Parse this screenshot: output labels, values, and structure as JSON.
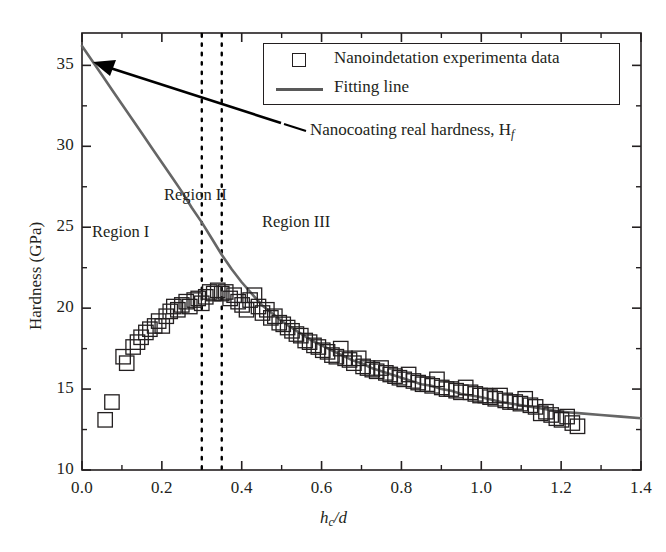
{
  "chart_data": {
    "type": "scatter",
    "title": "",
    "xlabel": "hc/d",
    "ylabel": "Hardness (GPa)",
    "xlim": [
      0.0,
      1.4
    ],
    "ylim": [
      10,
      37
    ],
    "grid": false,
    "x_ticks": [
      "0.0",
      "0.2",
      "0.4",
      "0.6",
      "0.8",
      "1.0",
      "1.2",
      "1.4"
    ],
    "x_tick_values": [
      0.0,
      0.2,
      0.4,
      0.6,
      0.8,
      1.0,
      1.2,
      1.4
    ],
    "y_ticks": [
      "10",
      "15",
      "20",
      "25",
      "30",
      "35"
    ],
    "y_tick_values": [
      10,
      15,
      20,
      25,
      30,
      35
    ],
    "minor_ticks": true,
    "legend_position": "top-right",
    "series": [
      {
        "name": "Nanoindetation experimenta data",
        "type": "scatter",
        "marker": "open-square",
        "color": "#231f20",
        "points": [
          [
            0.058,
            13.1
          ],
          [
            0.075,
            14.2
          ],
          [
            0.103,
            17.0
          ],
          [
            0.112,
            16.6
          ],
          [
            0.128,
            17.6
          ],
          [
            0.139,
            17.9
          ],
          [
            0.148,
            18.2
          ],
          [
            0.16,
            18.5
          ],
          [
            0.17,
            18.7
          ],
          [
            0.182,
            18.9
          ],
          [
            0.192,
            19.2
          ],
          [
            0.201,
            18.9
          ],
          [
            0.211,
            19.5
          ],
          [
            0.221,
            19.8
          ],
          [
            0.23,
            20.1
          ],
          [
            0.24,
            19.9
          ],
          [
            0.25,
            20.2
          ],
          [
            0.261,
            20.4
          ],
          [
            0.27,
            20.1
          ],
          [
            0.281,
            20.5
          ],
          [
            0.291,
            20.6
          ],
          [
            0.3,
            20.3
          ],
          [
            0.31,
            20.7
          ],
          [
            0.32,
            21.0
          ],
          [
            0.33,
            20.9
          ],
          [
            0.34,
            21.1
          ],
          [
            0.35,
            20.9
          ],
          [
            0.36,
            21.0
          ],
          [
            0.371,
            20.6
          ],
          [
            0.381,
            20.8
          ],
          [
            0.391,
            20.4
          ],
          [
            0.401,
            20.2
          ],
          [
            0.412,
            19.9
          ],
          [
            0.421,
            20.5
          ],
          [
            0.432,
            20.8
          ],
          [
            0.442,
            20.1
          ],
          [
            0.452,
            19.7
          ],
          [
            0.463,
            19.9
          ],
          [
            0.473,
            19.4
          ],
          [
            0.483,
            19.5
          ],
          [
            0.494,
            19.1
          ],
          [
            0.504,
            19.0
          ],
          [
            0.515,
            18.8
          ],
          [
            0.526,
            18.6
          ],
          [
            0.537,
            18.4
          ],
          [
            0.548,
            18.3
          ],
          [
            0.559,
            18.0
          ],
          [
            0.57,
            17.9
          ],
          [
            0.581,
            17.7
          ],
          [
            0.592,
            17.6
          ],
          [
            0.603,
            17.4
          ],
          [
            0.615,
            17.3
          ],
          [
            0.626,
            17.1
          ],
          [
            0.637,
            17.0
          ],
          [
            0.648,
            17.5
          ],
          [
            0.659,
            16.9
          ],
          [
            0.67,
            16.8
          ],
          [
            0.681,
            16.6
          ],
          [
            0.693,
            16.9
          ],
          [
            0.704,
            16.4
          ],
          [
            0.715,
            16.3
          ],
          [
            0.727,
            16.2
          ],
          [
            0.738,
            16.1
          ],
          [
            0.749,
            16.3
          ],
          [
            0.761,
            16.0
          ],
          [
            0.772,
            15.9
          ],
          [
            0.784,
            15.8
          ],
          [
            0.795,
            15.7
          ],
          [
            0.807,
            15.6
          ],
          [
            0.818,
            15.9
          ],
          [
            0.83,
            15.5
          ],
          [
            0.842,
            15.4
          ],
          [
            0.853,
            15.3
          ],
          [
            0.865,
            15.3
          ],
          [
            0.877,
            15.2
          ],
          [
            0.889,
            15.6
          ],
          [
            0.901,
            15.1
          ],
          [
            0.913,
            15.0
          ],
          [
            0.925,
            15.0
          ],
          [
            0.937,
            14.9
          ],
          [
            0.949,
            14.8
          ],
          [
            0.961,
            15.1
          ],
          [
            0.973,
            14.8
          ],
          [
            0.985,
            14.7
          ],
          [
            0.997,
            14.6
          ],
          [
            1.01,
            14.6
          ],
          [
            1.022,
            14.5
          ],
          [
            1.035,
            14.4
          ],
          [
            1.047,
            14.6
          ],
          [
            1.06,
            14.3
          ],
          [
            1.072,
            14.2
          ],
          [
            1.085,
            14.2
          ],
          [
            1.098,
            14.1
          ],
          [
            1.11,
            14.4
          ],
          [
            1.123,
            14.0
          ],
          [
            1.136,
            13.9
          ],
          [
            1.149,
            13.5
          ],
          [
            1.162,
            13.6
          ],
          [
            1.175,
            13.4
          ],
          [
            1.188,
            13.2
          ],
          [
            1.201,
            13.1
          ],
          [
            1.215,
            13.3
          ],
          [
            1.228,
            12.9
          ],
          [
            1.241,
            12.7
          ]
        ]
      },
      {
        "name": "Fitting line",
        "type": "line",
        "color": "#666666",
        "y_intercept": 36.2,
        "points": [
          [
            0.0,
            36.2
          ],
          [
            0.025,
            35.3
          ],
          [
            0.05,
            34.4
          ],
          [
            0.075,
            33.5
          ],
          [
            0.1,
            32.6
          ],
          [
            0.125,
            31.7
          ],
          [
            0.15,
            30.8
          ],
          [
            0.175,
            29.9
          ],
          [
            0.2,
            29.0
          ],
          [
            0.225,
            28.1
          ],
          [
            0.25,
            27.2
          ],
          [
            0.275,
            26.2
          ],
          [
            0.3,
            25.3
          ],
          [
            0.325,
            24.3
          ],
          [
            0.35,
            23.3
          ],
          [
            0.375,
            22.4
          ],
          [
            0.4,
            21.6
          ],
          [
            0.425,
            20.9
          ],
          [
            0.45,
            20.2
          ],
          [
            0.475,
            19.7
          ],
          [
            0.5,
            19.2
          ],
          [
            0.525,
            18.8
          ],
          [
            0.55,
            18.4
          ],
          [
            0.575,
            18.0
          ],
          [
            0.6,
            17.7
          ],
          [
            0.625,
            17.4
          ],
          [
            0.65,
            17.1
          ],
          [
            0.675,
            16.8
          ],
          [
            0.7,
            16.6
          ],
          [
            0.725,
            16.3
          ],
          [
            0.75,
            16.1
          ],
          [
            0.775,
            15.9
          ],
          [
            0.8,
            15.7
          ],
          [
            0.825,
            15.5
          ],
          [
            0.85,
            15.3
          ],
          [
            0.875,
            15.2
          ],
          [
            0.9,
            15.0
          ],
          [
            0.925,
            14.9
          ],
          [
            0.95,
            14.7
          ],
          [
            0.975,
            14.6
          ],
          [
            1.0,
            14.5
          ],
          [
            1.05,
            14.2
          ],
          [
            1.1,
            14.0
          ],
          [
            1.15,
            13.8
          ],
          [
            1.2,
            13.6
          ],
          [
            1.25,
            13.5
          ],
          [
            1.3,
            13.4
          ],
          [
            1.35,
            13.3
          ],
          [
            1.4,
            13.2
          ]
        ]
      }
    ],
    "vertical_reference_lines": [
      {
        "x": 0.3,
        "style": "dotted",
        "color": "#000000"
      },
      {
        "x": 0.35,
        "style": "dotted",
        "color": "#000000"
      }
    ],
    "annotations": [
      {
        "name": "region-1",
        "text": "Region I",
        "x": 0.135,
        "y": 23.0
      },
      {
        "name": "region-2",
        "text": "Region II",
        "x": 0.255,
        "y": 27.1
      },
      {
        "name": "region-3",
        "text": "Region III",
        "x": 0.455,
        "y": 25.3
      },
      {
        "name": "arrow-callout",
        "text": "Nanocoating real hardness, Hf",
        "text_plain": "Nanocoating real hardness, H",
        "subscript": "f",
        "x": 0.5,
        "y": 31.5
      }
    ]
  },
  "legend": {
    "items": [
      {
        "label": "Nanoindetation experimenta data",
        "marker": "open-square"
      },
      {
        "label": "Fitting line",
        "marker": "line"
      }
    ]
  },
  "axes": {
    "x_title": "hc/d",
    "x_title_base": "h",
    "x_title_sub": "c",
    "x_title_rest": "/d",
    "y_title": "Hardness (GPa)"
  },
  "ticks": {
    "x": [
      "0.0",
      "0.2",
      "0.4",
      "0.6",
      "0.8",
      "1.0",
      "1.2",
      "1.4"
    ],
    "y": [
      "10",
      "15",
      "20",
      "25",
      "30",
      "35"
    ]
  },
  "annotation": {
    "callout_base": "Nanocoating real hardness, H",
    "callout_sub": "f"
  },
  "regions": {
    "r1": "Region I",
    "r2": "Region II",
    "r3": "Region III"
  },
  "colors": {
    "fit_line": "#666666",
    "marker_edge": "#231f20",
    "axis": "#231f20",
    "dotted": "#000000"
  }
}
